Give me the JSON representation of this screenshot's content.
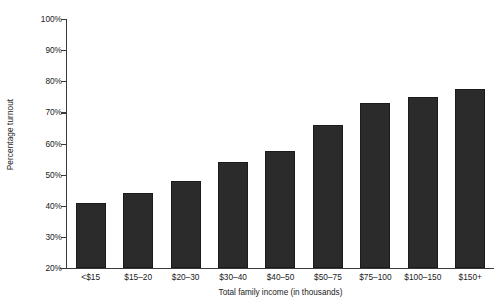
{
  "chart_data": {
    "type": "bar",
    "title": "",
    "xlabel": "Total family income (in thousands)",
    "ylabel": "Percentage turnout",
    "categories": [
      "<$15",
      "$15–20",
      "$20–30",
      "$30–40",
      "$40–50",
      "$50–75",
      "$75–100",
      "$100–150",
      "$150+"
    ],
    "values": [
      41,
      44,
      48,
      54,
      57.5,
      66,
      73,
      75,
      77.5
    ],
    "value_labels": [
      "41%",
      "44%",
      "48%",
      "54%",
      "57.5%",
      "66%",
      "73%",
      "75%",
      "77.5%"
    ],
    "ylim": [
      20,
      100
    ],
    "ytick_values": [
      20,
      30,
      40,
      50,
      60,
      70,
      80,
      90,
      100
    ],
    "ytick_labels": [
      "20%",
      "30%",
      "40%",
      "50%",
      "60%",
      "70%",
      "80%",
      "90%",
      "100%"
    ],
    "grid": false,
    "legend": false,
    "legend_position": "none",
    "bar_color": "#2b2b2b",
    "axis_color": "#3a3a3a",
    "background_color": "#ffffff",
    "text_color": "#1a1a1a"
  }
}
